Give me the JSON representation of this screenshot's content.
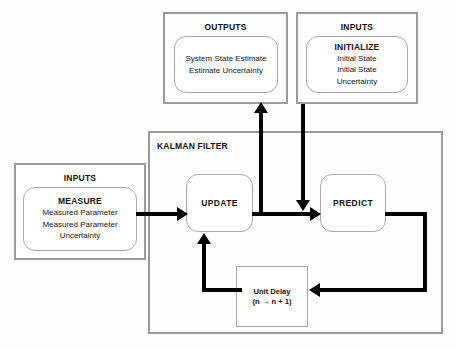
{
  "diagram": {
    "colors": {
      "frame_border": "#9a9a9a",
      "block_border": "#a8a8a8",
      "connector": "#000000",
      "background": "#ffffff",
      "text": "#111111"
    }
  },
  "outputs_group": {
    "title": "OUTPUTS",
    "block": {
      "lines": [
        "System State Estimate",
        "Estimate Uncertainty"
      ]
    }
  },
  "inputs_initialize_group": {
    "title": "INPUTS",
    "block": {
      "title": "INITIALIZE",
      "lines": [
        "Initial State",
        "Initial State",
        "Uncertainty"
      ]
    }
  },
  "inputs_measure_group": {
    "title": "INPUTS",
    "block": {
      "title": "MEASURE",
      "lines": [
        "Measured Parameter",
        "Measured Parameter",
        "Uncertainty"
      ]
    }
  },
  "kalman_filter": {
    "title": "KALMAN FILTER",
    "update_block": {
      "label": "UPDATE"
    },
    "predict_block": {
      "label": "PREDICT"
    },
    "unit_delay_block": {
      "title": "Unit Delay",
      "expression_left": "(n",
      "expression_arrow": "→",
      "expression_right": "n + 1)"
    }
  },
  "connectors": [
    {
      "name": "measure-to-update",
      "from": "MEASURE",
      "to": "UPDATE",
      "direction": "right"
    },
    {
      "name": "update-to-predict",
      "from": "UPDATE",
      "to": "PREDICT",
      "direction": "right"
    },
    {
      "name": "update-to-outputs",
      "from": "UPDATE",
      "to": "OUTPUTS",
      "direction": "up"
    },
    {
      "name": "initialize-to-predict",
      "from": "INITIALIZE",
      "to": "PREDICT",
      "direction": "down"
    },
    {
      "name": "predict-to-unit-delay",
      "from": "PREDICT",
      "to": "Unit Delay",
      "direction": "left"
    },
    {
      "name": "unit-delay-to-update",
      "from": "Unit Delay",
      "to": "UPDATE",
      "direction": "up"
    }
  ]
}
